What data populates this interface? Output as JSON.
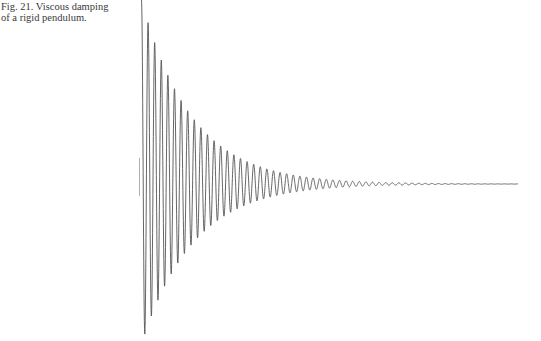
{
  "caption": {
    "line1": "Fig. 21. Viscous damping",
    "line2": "of a rigid pendulum."
  },
  "chart_data": {
    "type": "line",
    "title": "Fig. 21. Viscous damping of a rigid pendulum.",
    "xlabel": "",
    "ylabel": "",
    "axes_visible": false,
    "grid": false,
    "legend": "none",
    "series": [
      {
        "name": "pendulum displacement",
        "model": "A0 * exp(-decay * t) * cos(2*pi*t/period)",
        "A0": 1.0,
        "decay_per_cycle": 0.13,
        "cycles_total": 57,
        "cycles_visible_oscillation": 36,
        "peak_amplitudes_relative": [
          1.0,
          0.87,
          0.76,
          0.67,
          0.59,
          0.52,
          0.45,
          0.39,
          0.34,
          0.3,
          0.26,
          0.23,
          0.2,
          0.17,
          0.15,
          0.13,
          0.11,
          0.1,
          0.085,
          0.075,
          0.065,
          0.055,
          0.048,
          0.042,
          0.036,
          0.031,
          0.027,
          0.023,
          0.02,
          0.017
        ]
      }
    ],
    "color": "#555555"
  }
}
